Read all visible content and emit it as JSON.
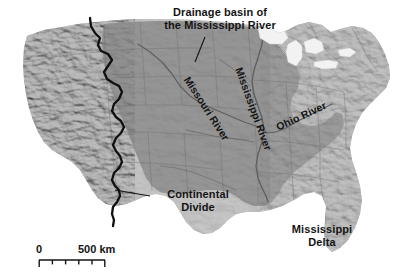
{
  "figure": {
    "type": "thematic-physiographic-map",
    "region": "Contiguous United States",
    "subject": "Drainage basin of the Mississippi River"
  },
  "labels": {
    "title": "Drainage basin of\nthe Mississippi River",
    "continental_divide": "Continental\nDivide",
    "mississippi_delta": "Mississippi\nDelta",
    "missouri_river": "Missouri River",
    "mississippi_river": "Mississippi River",
    "ohio_river": "Ohio River"
  },
  "scale": {
    "zero": "0",
    "max": "500 km",
    "divisions": 5
  },
  "colors": {
    "basin_fill": "#8e8e8e",
    "outside_fill": "#c4c4c4",
    "water": "#ffffff",
    "divide_line": "#101010",
    "river_line": "#6a6a6a",
    "state_border": "#6f6f6f",
    "label_text": "#141414",
    "background": "#ffffff"
  },
  "map_features": {
    "drainage_basin": "shaded darker gray, bounded west by the Continental Divide and east by the Appalachians",
    "continental_divide": "thick black jagged line running north-south through the Rocky Mountains",
    "rivers": [
      "Missouri River",
      "Mississippi River",
      "Ohio River"
    ],
    "relief": "grayscale shaded relief, strongest in the western mountain ranges",
    "great_lakes": "pale water bodies in the north-central/northeast",
    "gulf_coast": "Mississippi Delta at the river mouth on the Gulf of Mexico"
  }
}
